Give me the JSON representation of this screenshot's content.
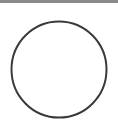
{
  "top_bar": {
    "color": "#8a8a8a"
  },
  "shape": {
    "type": "circle",
    "icon": "circle-outline-icon",
    "stroke_color": "#3a3a3a",
    "fill_color": "#ffffff",
    "stroke_width": 2
  }
}
